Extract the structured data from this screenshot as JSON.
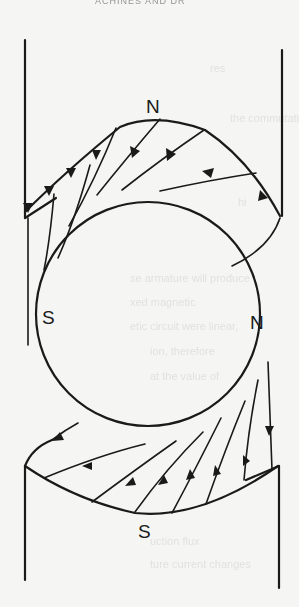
{
  "figure": {
    "header_fragment": "ACHINES AND DR",
    "poles": {
      "top_stator": "N",
      "bottom_stator": "S",
      "rotor_left": "S",
      "rotor_right": "N"
    },
    "colors": {
      "ink": "#1a1a1a",
      "paper": "#f5f5f3"
    }
  },
  "bleed_through_text": [
    "res",
    "the commutating",
    "hi",
    "se armature will produce",
    "xed magnetic",
    "etic circuit were linear,",
    "ion, therefore",
    "at the value of",
    "r at",
    "uction flux",
    "ture current changes",
    "uction",
    "with"
  ]
}
